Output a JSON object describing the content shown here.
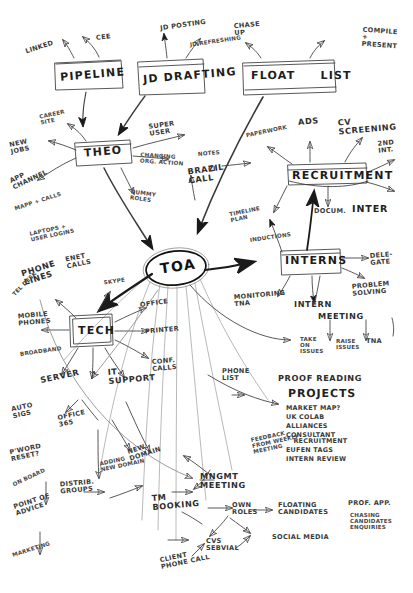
{
  "document": {
    "type": "hand-drawn-mind-map",
    "title": "TOA",
    "medium": "pencil on white paper",
    "ink_color": "#2b2b2b",
    "paper_color": "#ffffff"
  },
  "center": {
    "label": "TOA",
    "shape": "ellipse"
  },
  "boxes": [
    {
      "id": "pipeline",
      "label": "PIPELINE"
    },
    {
      "id": "jd_drafting",
      "label": "JD DRAFTING"
    },
    {
      "id": "float_list",
      "label": "FLOAT  LIST"
    },
    {
      "id": "theo",
      "label": "THEO"
    },
    {
      "id": "recruitment",
      "label": "RECRUITMENT"
    },
    {
      "id": "interns",
      "label": "INTERNS"
    },
    {
      "id": "tech",
      "label": "TECH"
    }
  ],
  "branches": {
    "pipeline": {
      "label": "PIPELINE",
      "children": [
        "LINKED",
        "CEE"
      ]
    },
    "jd_drafting": {
      "label": "JD DRAFTING",
      "children": [
        "JD POSTING",
        "JD REFRESHING"
      ]
    },
    "float_list": {
      "label": "FLOAT  LIST",
      "children": [
        "CHASE UP",
        "COMPILE + PRESENT"
      ]
    },
    "theo": {
      "label": "THEO",
      "children": [
        "CAREER SITE",
        "NEW JOBS",
        "APP CHANNEL",
        "MAPP + CALLS",
        "SUPER USER",
        "CHANGING ORG. ACTION",
        "DUMMY ROLES",
        "BRAZIL CALL",
        "NOTES",
        "CI"
      ]
    },
    "recruitment": {
      "label": "RECRUITMENT",
      "children": [
        "PAPERWORK",
        "ADS",
        "CV SCREENING",
        "2ND INT.",
        "TIMELINE PLAN",
        "INDUCTIONS",
        "DOCUM.",
        "INTER"
      ]
    },
    "interns": {
      "label": "INTERNS",
      "children": [
        "DELEGATE",
        "PROBLEM SOLVING",
        "MONITORING TNA",
        "INTERN MEETING",
        "TAKE ON ISSUES",
        "RAISE ISSUES",
        "TNA"
      ]
    },
    "tech": {
      "label": "TECH",
      "children": [
        "PHONE LINES",
        "MOBILE PHONES",
        "BROADBAND",
        "ENET CALLS",
        "SKYPE",
        "OFFICE",
        "PRINTER",
        "CONF. CALLS",
        "SERVER",
        "IT SUPPORT",
        "AUTO SIGS",
        "OFFICE 365",
        "P'WORD RESET",
        "DISTRIB. GROUPS",
        "ADDING NEW DOMAIN",
        "NEW DOMAIN"
      ]
    },
    "loose": {
      "label": "",
      "children": [
        "PHONE LIST",
        "PROOF READING",
        "TM BOOKING",
        "POINT OF ADVICE",
        "ON BOARD",
        "MARKETING",
        "CLIENT PHONE CALL"
      ]
    },
    "projects": {
      "label": "PROJECTS",
      "items": [
        "MARKET MAP?",
        "UK COLAB",
        "ALLIANCES",
        "CONSULTANT RECRUITMENT",
        "EUFEN TAGS",
        "INTERN REVIEW"
      ]
    },
    "mngmt_meeting": {
      "label": "MNGMT MEETING",
      "children": [
        "FEEDBACK FROM WEEKLY MEETING",
        "OWN ROLES",
        "CVS SEBVIAL",
        "FLOATING CANDIDATES",
        "SOCIAL MEDIA",
        "PROF. APP.",
        "CHASING CANDIDATES ENQUIRIES"
      ]
    }
  },
  "labels": {
    "linked": "LINKED",
    "cee": "CEE",
    "pipeline": "PIPELINE",
    "jd_posting": "JD POSTING",
    "jd_refreshing": "JD REFRESHING",
    "jd_drafting": "JD DRAFTING",
    "chase_up": "CHASE\nUP",
    "compile_present": "COMPILE\n+\nPRESENT",
    "float_list": "FLOAT     LIST",
    "career_site": "CAREER\nSITE",
    "new_jobs": "NEW\nJOBS",
    "app_channel": "APP\nCHANNEL",
    "mapp_calls": "MAPP + CALLS",
    "theo": "THEO",
    "super_user": "SUPER\nUSER",
    "changing_org": "CHANGING\nORG. ACTION",
    "dummy_roles": "DUMMY\nROLES",
    "brazil_call": "BRAZIL\nCALL",
    "notes": "NOTES",
    "ci": "CI",
    "laptops_logins": "LAPTOPS +\nUSER LOGINS",
    "enet_calls": "ENET\nCALLS",
    "skype": "SKYPE",
    "phone_lines": "PHONE\nLINES",
    "tel_desk": "TEL DESK",
    "mobile_phones": "MOBILE\nPHONES",
    "broadband": "BROADBAND",
    "tech": "TECH",
    "office": "OFFICE",
    "printer": "PRINTER",
    "conf_calls": "CONF.\nCALLS",
    "server": "SERVER",
    "it_support": "IT\nSUPPORT",
    "auto_sigs": "AUTO\nSIGS",
    "office_365": "OFFICE\n365",
    "pword_reset": "P'WORD\nRESET?",
    "distrib_groups": "DISTRIB.\nGROUPS",
    "adding_new_domain": "ADDING\nNEW DOMAIN",
    "new_domain": "NEW\nDOMAIN",
    "tm_booking": "TM\nBOOKING",
    "point_of_advice": "POINT OF\nADVICE",
    "on_board": "ON BOARD",
    "marketing": "MARKETING",
    "paperwork": "PAPERWORK",
    "ads": "ADS",
    "cv_screening": "CV\nSCREENING",
    "second_int": "2ND\nINT.",
    "recruitment": "RECRUITMENT",
    "timeline_plan": "TIMELINE\nPLAN",
    "inductions": "INDUCTIONS",
    "docum": "DOCUM.",
    "inter": "INTER",
    "interns": "INTERNS",
    "delegate": "DELE-\nGATE",
    "problem_solving": "PROBLEM\nSOLVING",
    "monitoring_tna": "MONITORING\nTNA",
    "intern": "INTERN",
    "meeting": "MEETING",
    "take_on_issues": "TAKE\nON\nISSUES",
    "raise_issues": "RAISE\nISSUES",
    "tna": "TNA",
    "phone_list": "PHONE\nLIST",
    "proof_reading": "PROOF READING",
    "projects": "PROJECTS",
    "feedback_weekly": "FEEDBACK\nFROM WEEKLY\nMEETING",
    "mngmt_meeting": "MNGMT\nMEETING",
    "own_roles": "OWN\nROLES",
    "cvs_sebvial": "CVS\nSEBVIAL",
    "floating_candidates": "FLOATING\nCANDIDATES",
    "social_media": "SOCIAL MEDIA",
    "prof_app": "PROF. APP.",
    "chasing_candidates": "CHASING\nCANDIDATES\nENQUIRIES",
    "client_phone_call": "CLIENT\nPHONE CALL"
  },
  "projects_items": [
    "MARKET MAP?",
    "UK COLAB",
    "ALLIANCES",
    "CONSULTANT\n   RECRUITMENT",
    "EUFEN TAGS",
    "INTERN REVIEW"
  ]
}
